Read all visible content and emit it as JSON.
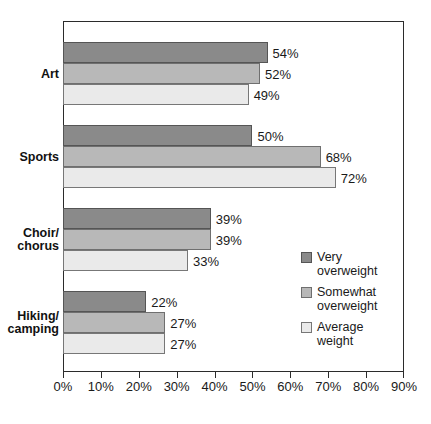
{
  "chart_data": {
    "type": "bar",
    "orientation": "horizontal",
    "title": "",
    "xlabel": "",
    "ylabel": "",
    "xlim": [
      0,
      90
    ],
    "xticks": [
      0,
      10,
      20,
      30,
      40,
      50,
      60,
      70,
      80,
      90
    ],
    "xtick_labels": [
      "0%",
      "10%",
      "20%",
      "30%",
      "40%",
      "50%",
      "60%",
      "70%",
      "80%",
      "90%"
    ],
    "grid": false,
    "legend_position": "inside-right",
    "categories": [
      "Art",
      "Sports",
      "Choir/\nchorus",
      "Hiking/\ncamping"
    ],
    "series": [
      {
        "name": "Very\noverweight",
        "color": "#8a8a8a",
        "values": [
          54,
          50,
          39,
          22
        ],
        "labels": [
          "54%",
          "50%",
          "39%",
          "22%"
        ]
      },
      {
        "name": "Somewhat\noverweight",
        "color": "#b8b8b8",
        "values": [
          52,
          68,
          39,
          27
        ],
        "labels": [
          "52%",
          "68%",
          "39%",
          "27%"
        ]
      },
      {
        "name": "Average\nweight",
        "color": "#eaeaea",
        "values": [
          49,
          72,
          33,
          27
        ],
        "labels": [
          "49%",
          "72%",
          "33%",
          "27%"
        ]
      }
    ]
  },
  "legend": {
    "items": [
      {
        "label": "Very\noverweight",
        "color": "#8a8a8a"
      },
      {
        "label": "Somewhat\noverweight",
        "color": "#b8b8b8"
      },
      {
        "label": "Average\nweight",
        "color": "#eaeaea"
      }
    ]
  }
}
